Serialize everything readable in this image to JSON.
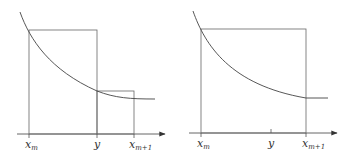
{
  "panels": [
    {
      "id": "left",
      "labels": {
        "xm": "x",
        "xm_sub": "m",
        "y": "y",
        "xm1": "x",
        "xm1_sub": "m+1"
      }
    },
    {
      "id": "right",
      "labels": {
        "xm": "x",
        "xm_sub": "m",
        "y": "y",
        "xm1": "x",
        "xm1_sub": "m+1"
      }
    }
  ],
  "colors": {
    "line": "#555555",
    "curve": "#444444"
  }
}
